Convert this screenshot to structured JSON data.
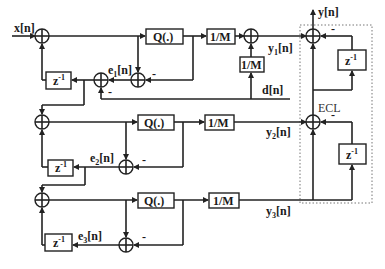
{
  "diagram": {
    "type": "signal-flow block diagram",
    "inputs": {
      "x": "x[n]",
      "d": "d[n]"
    },
    "output": {
      "y": "y[n]"
    },
    "blocks": {
      "quantizer": "Q(.)",
      "scale": "1/M",
      "delay": {
        "base": "z",
        "exp": "-1"
      }
    },
    "signals": {
      "e1": {
        "base": "e",
        "sub": "1",
        "tail": "[n]"
      },
      "e2": {
        "base": "e",
        "sub": "2",
        "tail": "[n]"
      },
      "e3": {
        "base": "e",
        "sub": "3",
        "tail": "[n]"
      },
      "y1": {
        "base": "y",
        "sub": "1",
        "tail": "[n]"
      },
      "y2": {
        "base": "y",
        "sub": "2",
        "tail": "[n]"
      },
      "y3": {
        "base": "y",
        "sub": "3",
        "tail": "[n]"
      }
    },
    "signs": {
      "minus": "-"
    },
    "region_label": "ECL",
    "colors": {
      "line": "#222222",
      "dotted_border": "#777777",
      "background": "#ffffff"
    }
  }
}
